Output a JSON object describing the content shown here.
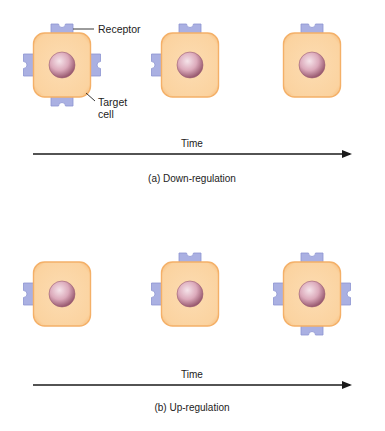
{
  "colors": {
    "cell_fill": "#fbd6a6",
    "cell_border": "#f4b068",
    "receptor_fill": "#aab0e2",
    "receptor_border": "#8d94d2",
    "nucleus_light": "#f3dde4",
    "nucleus_mid": "#d9a6b7",
    "nucleus_dark": "#9c5e74",
    "arrow": "#1a1a1a",
    "text": "#222222"
  },
  "labels": {
    "receptor": "Receptor",
    "target_line1": "Target",
    "target_line2": "cell"
  },
  "panels": [
    {
      "id": "a",
      "axis_label": "Time",
      "caption": "(a) Down-regulation",
      "cells": [
        {
          "receptors": [
            "top",
            "left",
            "right",
            "bottom"
          ]
        },
        {
          "receptors": [
            "top",
            "left"
          ]
        },
        {
          "receptors": [
            "top"
          ]
        }
      ]
    },
    {
      "id": "b",
      "axis_label": "Time",
      "caption": "(b) Up-regulation",
      "cells": [
        {
          "receptors": [
            "left"
          ]
        },
        {
          "receptors": [
            "top",
            "left"
          ]
        },
        {
          "receptors": [
            "top",
            "left",
            "right",
            "bottom"
          ]
        }
      ]
    }
  ]
}
